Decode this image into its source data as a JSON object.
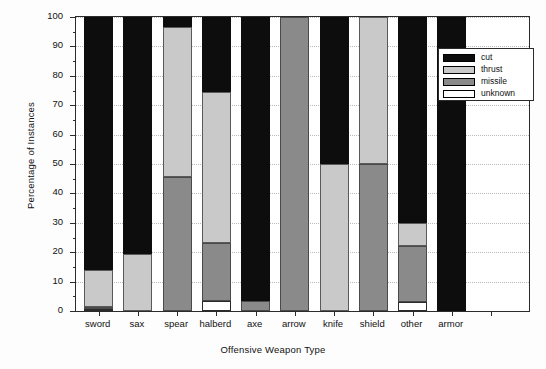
{
  "chart_data": {
    "type": "bar",
    "subtype": "stacked-bar-100-percent",
    "title": "",
    "xlabel": "Offensive Weapon Type",
    "ylabel": "Percentage of Instances",
    "ylim": [
      0,
      100
    ],
    "ytick_step": 10,
    "yminor_step": 5,
    "grid": "horizontal-dotted",
    "legend_position": "top-right-inside",
    "categories": [
      "sword",
      "sax",
      "spear",
      "halberd",
      "axe",
      "arrow",
      "knife",
      "shield",
      "other",
      "armor"
    ],
    "ytick_labels": [
      "0",
      "10",
      "20",
      "30",
      "40",
      "50",
      "60",
      "70",
      "80",
      "90",
      "100"
    ],
    "series": [
      {
        "name": "unknown",
        "color": "#ffffff",
        "values": [
          0.7,
          0,
          0,
          3.5,
          0,
          0,
          0,
          0,
          3.0,
          0
        ]
      },
      {
        "name": "missile",
        "color": "#8a8a8a",
        "values": [
          0.5,
          0,
          45.5,
          19.5,
          3.5,
          100,
          0,
          50,
          19.0,
          0
        ]
      },
      {
        "name": "thrust",
        "color": "#c9c9c9",
        "values": [
          12.8,
          19.5,
          51.0,
          51.5,
          0,
          0,
          50,
          50,
          8.0,
          0
        ]
      },
      {
        "name": "cut",
        "color": "#0d0d0d",
        "values": [
          86.0,
          80.5,
          3.5,
          25.5,
          96.5,
          0,
          50,
          0,
          70.0,
          100
        ]
      }
    ]
  },
  "legend": {
    "entries": [
      {
        "label": "cut",
        "color": "#0d0d0d"
      },
      {
        "label": "thrust",
        "color": "#c9c9c9"
      },
      {
        "label": "missile",
        "color": "#8a8a8a"
      },
      {
        "label": "unknown",
        "color": "#ffffff"
      }
    ]
  }
}
